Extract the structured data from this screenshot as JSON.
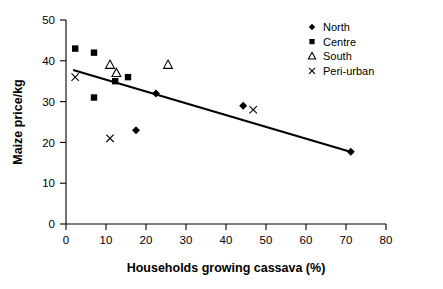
{
  "chart_data": {
    "type": "scatter",
    "title": "",
    "xlabel": "Households growing cassava (%)",
    "ylabel": "Maize price/kg",
    "xlim": [
      0,
      80
    ],
    "ylim": [
      0,
      50
    ],
    "xticks": [
      0,
      10,
      20,
      30,
      40,
      50,
      60,
      70,
      80
    ],
    "yticks": [
      0,
      10,
      20,
      30,
      40,
      50
    ],
    "grid": false,
    "legend_position": "top-right",
    "series": [
      {
        "name": "North",
        "marker": "diamond-filled",
        "points": [
          {
            "x": 17.5,
            "y": 23
          },
          {
            "x": 22.5,
            "y": 32
          },
          {
            "x": 44.3,
            "y": 29
          },
          {
            "x": 71.2,
            "y": 17.7
          }
        ]
      },
      {
        "name": "Centre",
        "marker": "square-filled",
        "points": [
          {
            "x": 2.3,
            "y": 43
          },
          {
            "x": 7.0,
            "y": 42
          },
          {
            "x": 7.0,
            "y": 31
          },
          {
            "x": 12.3,
            "y": 35
          },
          {
            "x": 15.5,
            "y": 36
          }
        ]
      },
      {
        "name": "South",
        "marker": "triangle-open",
        "points": [
          {
            "x": 11.0,
            "y": 39
          },
          {
            "x": 12.6,
            "y": 37
          },
          {
            "x": 25.5,
            "y": 39
          }
        ]
      },
      {
        "name": "Peri-urban",
        "marker": "cross-x",
        "points": [
          {
            "x": 2.3,
            "y": 36
          },
          {
            "x": 11.0,
            "y": 21
          },
          {
            "x": 46.8,
            "y": 28
          }
        ]
      }
    ],
    "trendline": {
      "x_start": 2.0,
      "y_start": 37.7,
      "x_end": 71.5,
      "y_end": 17.6
    },
    "colors": {
      "marker": "#000000",
      "axis": "#000000",
      "trendline": "#000000",
      "background": "#ffffff"
    }
  },
  "legend": {
    "entries": [
      {
        "label": "North"
      },
      {
        "label": "Centre"
      },
      {
        "label": "South"
      },
      {
        "label": "Peri-urban"
      }
    ]
  },
  "axes": {
    "x_title": "Households growing cassava (%)",
    "y_title": "Maize price/kg",
    "x_tick_labels": [
      "0",
      "10",
      "20",
      "30",
      "40",
      "50",
      "60",
      "70",
      "80"
    ],
    "y_tick_labels": [
      "0",
      "10",
      "20",
      "30",
      "40",
      "50"
    ]
  }
}
